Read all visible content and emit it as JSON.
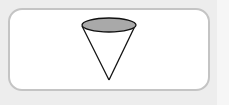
{
  "diagram": {
    "shape": "cone",
    "colors": {
      "top_fill": "#a9a9a9",
      "outline": "#111111",
      "card_border": "#c4c4c4",
      "background": "#ededed"
    }
  }
}
